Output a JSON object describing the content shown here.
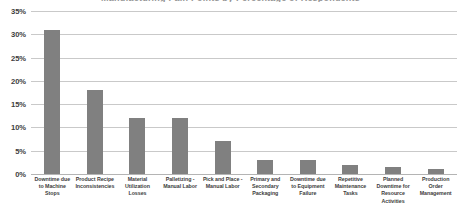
{
  "chart_data": {
    "type": "bar",
    "title": "Manufacturing Pain Points by Percentage of Respondents",
    "subtitle": "",
    "xlabel": "",
    "ylabel": "",
    "ylim": [
      0,
      35
    ],
    "ytick_labels": [
      "0%",
      "5%",
      "10%",
      "15%",
      "20%",
      "25%",
      "30%",
      "35%"
    ],
    "ytick_values": [
      0,
      5,
      10,
      15,
      20,
      25,
      30,
      35
    ],
    "grid": true,
    "legend": false,
    "legend_position": "none",
    "bar_color": "#808080",
    "gridline_color": "#c9c9c9",
    "axis_label_color": "#404040",
    "categories": [
      "Downtime due to Machine Stops",
      "Product Recipe Inconsistencies",
      "Material Utilization Losses",
      "Palletizing - Manual Labor",
      "Pick and Place - Manual Labor",
      "Primary and Secondary Packaging",
      "Downtime due to Equipment Failure",
      "Repetitive Maintenance Tasks",
      "Planned Downtime for Resource Activities",
      "Production Order Management"
    ],
    "values": [
      31,
      18,
      12,
      12,
      7,
      3,
      3,
      2,
      1.5,
      1
    ],
    "value_labels": [
      "31%",
      "18%",
      "12%",
      "12%",
      "7%",
      "3%",
      "3%",
      "2%",
      "1.5%",
      "1%"
    ],
    "data_labels_visible": false
  }
}
